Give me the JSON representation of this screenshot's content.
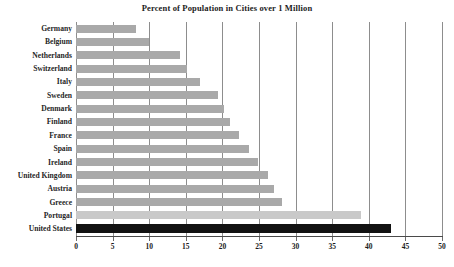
{
  "chart": {
    "title": "Percent of Population in Cities over 1 Million"
  },
  "colors": {
    "bar_default": "#a9a9a9",
    "bar_light": "#c9c9c9",
    "bar_highlight": "#121212",
    "gridline": "#8d8d8d",
    "axis": "#4a4a4a",
    "text": "#1c1c1c",
    "background": "#ffffff"
  },
  "chart_data": {
    "type": "bar",
    "orientation": "horizontal",
    "title": "Percent of Population in Cities over 1 Million",
    "xlabel": "",
    "ylabel": "",
    "xlim": [
      0,
      50
    ],
    "xticks": [
      0,
      5,
      10,
      15,
      20,
      25,
      30,
      35,
      40,
      45,
      50
    ],
    "xtick_labels": [
      "0",
      "5",
      "10",
      "15",
      "20",
      "25",
      "30",
      "35",
      "40",
      "45",
      "50"
    ],
    "grid": "vertical",
    "legend": "none",
    "categories": [
      "Germany",
      "Belgium",
      "Netherlands",
      "Switzerland",
      "Italy",
      "Sweden",
      "Denmark",
      "Finland",
      "France",
      "Spain",
      "Ireland",
      "United Kingdom",
      "Austria",
      "Greece",
      "Portugal",
      "United States"
    ],
    "values": [
      8.2,
      10,
      14.2,
      15.2,
      17,
      19.4,
      20.2,
      21,
      22.2,
      23.6,
      24.9,
      26.2,
      27,
      28.2,
      39,
      43
    ],
    "bar_styles": [
      "default",
      "default",
      "default",
      "default",
      "default",
      "default",
      "default",
      "default",
      "default",
      "default",
      "default",
      "default",
      "default",
      "default",
      "light",
      "highlight"
    ]
  }
}
